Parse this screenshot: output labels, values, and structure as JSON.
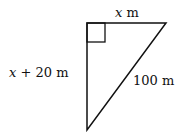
{
  "diagram": {
    "type": "right-triangle",
    "labels": {
      "top_var": "x",
      "top_unit": " m",
      "left_var": "x",
      "left_rest": " + 20 m",
      "hypotenuse": "100 m"
    },
    "colors": {
      "stroke": "#111111"
    }
  }
}
